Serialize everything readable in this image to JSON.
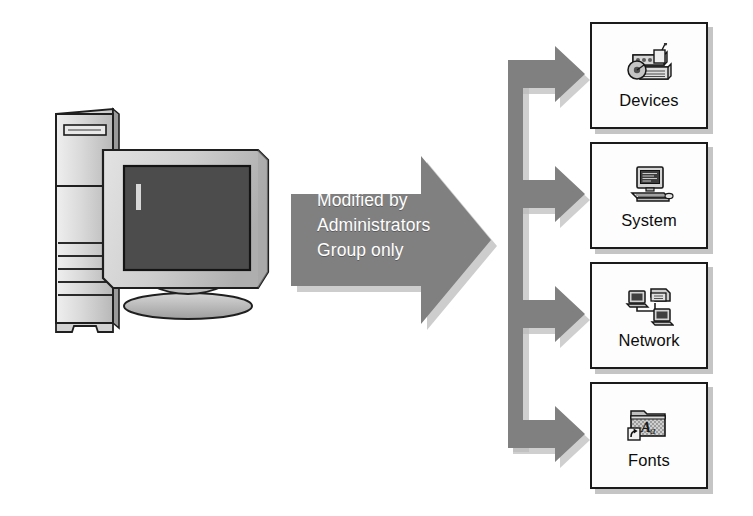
{
  "diagram": {
    "title": "Modified by Administrators Group only",
    "background_color": "#ffffff",
    "arrow_color": "#808080",
    "arrow_shadow_color": "#b3b3b3",
    "box_border_color": "#1b1b1b",
    "box_fill_color": "#fdfdfd",
    "box_shadow_color": "#969696",
    "label_text_color": "#ffffff"
  },
  "source": {
    "name": "computer",
    "icon": "desktop-computer-illustration",
    "parts": [
      "tower-case",
      "crt-monitor",
      "monitor-base"
    ]
  },
  "main_arrow": {
    "name": "modified-by-arrow",
    "label": "Modified by\nAdministrators\nGroup only",
    "label_lines": [
      "Modified by",
      "Administrators",
      "Group only"
    ],
    "direction": "right"
  },
  "connector": {
    "name": "branch-connector",
    "type": "vertical-spine-with-four-right-arrows",
    "branch_count": 4
  },
  "targets": [
    {
      "id": "devices",
      "label": "Devices",
      "icon": "devices-hardware-icon"
    },
    {
      "id": "system",
      "label": "System",
      "icon": "computer-system-icon"
    },
    {
      "id": "network",
      "label": "Network",
      "icon": "network-computers-icon"
    },
    {
      "id": "fonts",
      "label": "Fonts",
      "icon": "fonts-folder-shortcut-icon"
    }
  ]
}
